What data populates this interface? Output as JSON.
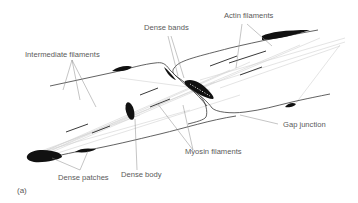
{
  "figure": {
    "panel_label": "(a)",
    "labels": {
      "intermediate_filaments": "Intermediate filaments",
      "dense_bands": "Dense bands",
      "actin_filaments": "Actin filaments",
      "gap_junction": "Gap junction",
      "myosin_filaments": "Myosin filaments",
      "dense_body": "Dense body",
      "dense_patches": "Dense patches"
    },
    "colors": {
      "outline": "#3a3a3a",
      "dense": "#111111",
      "filament": "#c8c8c8",
      "leader": "#8a8a8a",
      "text": "#5a5a5a"
    }
  }
}
